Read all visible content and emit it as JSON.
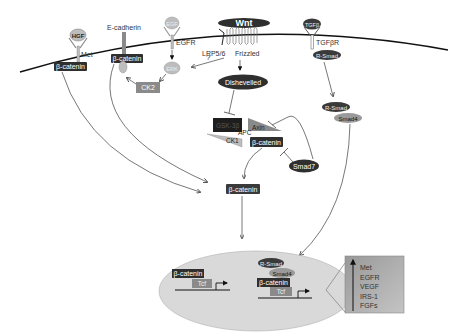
{
  "diagram": {
    "colors": {
      "dark_box": "#2f2f2f",
      "grey_box": "#8a8a8a",
      "light_oval": "#bdbdbd",
      "nucleus_fill": "#d9d9d9",
      "target_box": "#a8a8a8",
      "membrane": "#111111",
      "edge": "#555555"
    },
    "ligands": {
      "hgf": "HGF",
      "egf": "EGF",
      "wnt": "Wnt",
      "tgfb": "TGFβ"
    },
    "receptors": {
      "met": "Met",
      "ecadherin": "E-cadherin",
      "egfr": "EGFR",
      "lrp": "LRP5/6",
      "frizzled": "Frizzled",
      "tgfbr": "TGFβR"
    },
    "nodes": {
      "bcat_met": "β-catenin",
      "bcat_ecad": "β-catenin",
      "erk": "ERK",
      "ck2": "CK2",
      "question": "?",
      "dishevelled": "Dishevelled",
      "gsk3b": "GSK-3β",
      "apc": "APC",
      "axin": "Axin",
      "ck1": "CK1",
      "bcat_complex": "β-catenin",
      "smad7": "Smad7",
      "rsmad_membrane": "R-Smad",
      "rsmad_cyto": "R-Smad",
      "smad4_cyto": "Smad4",
      "bcat_free": "β-catenin"
    },
    "nucleus": {
      "left_bcat": "β-catenin",
      "left_tcf": "Tcf",
      "right_rsmad": "R-Smad",
      "right_smad4": "Smad4",
      "right_bcat": "β-catenin",
      "right_tcf": "Tcf"
    },
    "target_genes": {
      "items": [
        "Met",
        "EGFR",
        "VEGF",
        "IRS-1",
        "FGFs"
      ]
    }
  }
}
